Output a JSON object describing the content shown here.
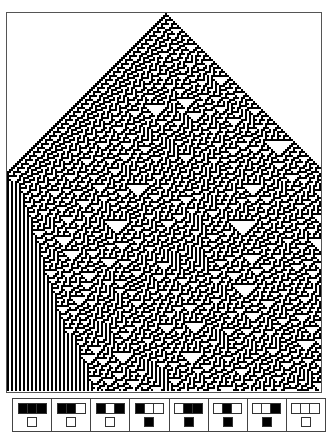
{
  "title_strip": "",
  "automaton": {
    "rule_number": 30,
    "cell_px": 2,
    "columns": 157,
    "rows": 189,
    "seed_column": 79,
    "on_color": "#000000",
    "off_color": "#ffffff"
  },
  "rule_icons": [
    {
      "neighborhood": [
        1,
        1,
        1
      ],
      "output": 0
    },
    {
      "neighborhood": [
        1,
        1,
        0
      ],
      "output": 0
    },
    {
      "neighborhood": [
        1,
        0,
        1
      ],
      "output": 0
    },
    {
      "neighborhood": [
        1,
        0,
        0
      ],
      "output": 1
    },
    {
      "neighborhood": [
        0,
        1,
        1
      ],
      "output": 1
    },
    {
      "neighborhood": [
        0,
        1,
        0
      ],
      "output": 1
    },
    {
      "neighborhood": [
        0,
        0,
        1
      ],
      "output": 1
    },
    {
      "neighborhood": [
        0,
        0,
        0
      ],
      "output": 0
    }
  ]
}
